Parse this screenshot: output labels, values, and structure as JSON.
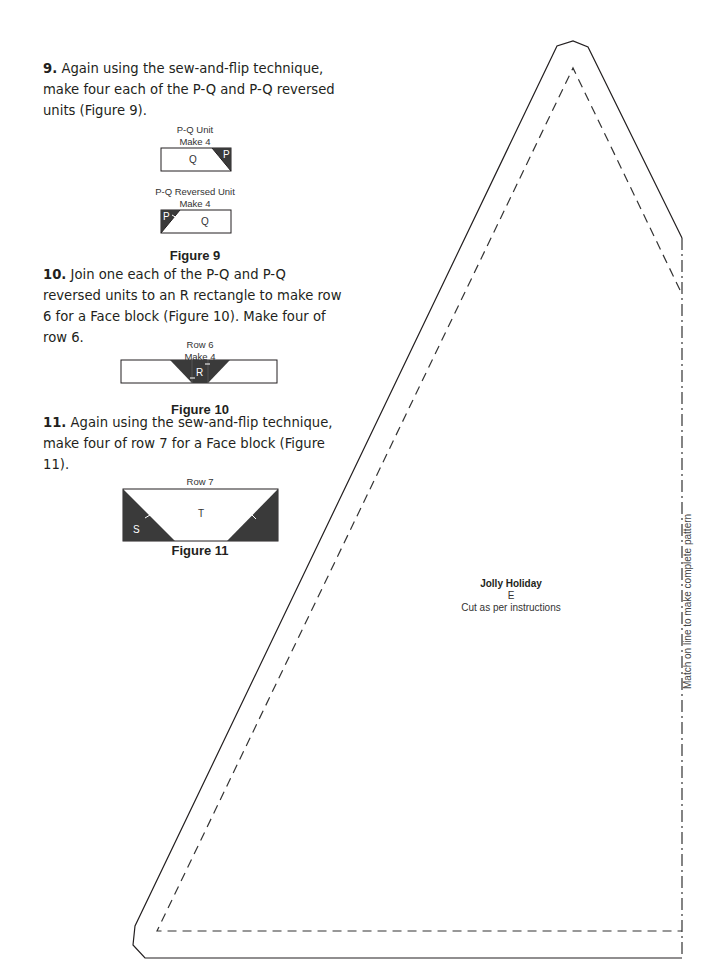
{
  "steps": [
    {
      "number": "9.",
      "text": "Again using the sew-and-flip technique, make four each of the P-Q and P-Q reversed units (Figure 9)."
    },
    {
      "number": "10.",
      "text": "Join one each of the P-Q and P-Q reversed units to an R rectangle to make row 6 for a Face block (Figure 10). Make four of row 6."
    },
    {
      "number": "11.",
      "text": "Again using the sew-and-flip technique, make four of row 7 for a Face block (Figure 11)."
    }
  ],
  "figure9": {
    "label": "Figure 9",
    "unit1": {
      "title": "P-Q Unit",
      "make": "Make 4",
      "main": "Q",
      "corner": "P"
    },
    "unit2": {
      "title": "P-Q Reversed Unit",
      "make": "Make 4",
      "main": "Q",
      "corner": "P"
    }
  },
  "figure10": {
    "label": "Figure 10",
    "title": "Row 6",
    "make": "Make 4",
    "center": "R"
  },
  "figure11": {
    "label": "Figure 11",
    "title": "Row 7",
    "make": "Make 4",
    "center": "T",
    "corner": "S"
  },
  "pattern": {
    "name": "Jolly Holiday",
    "piece": "E",
    "instruction": "Cut as per instructions",
    "side_note": "Match on line to make complete pattern"
  },
  "colors": {
    "dark_fabric": "#3a3a3a",
    "line": "#231f20"
  }
}
